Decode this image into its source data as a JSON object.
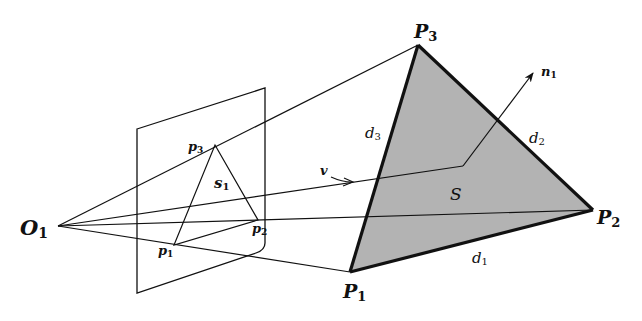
{
  "diagram": {
    "type": "perspective-projection",
    "colors": {
      "line": "#111111",
      "triangle_fill": "#b3b3b3",
      "background": "#ffffff"
    },
    "labels": {
      "camera_center": {
        "main": "O",
        "sub": "1"
      },
      "image_triangle": {
        "main": "s",
        "sub": "1"
      },
      "image_vertices": [
        {
          "main": "p",
          "sub": "1"
        },
        {
          "main": "p",
          "sub": "2"
        },
        {
          "main": "p",
          "sub": "3"
        }
      ],
      "world_vertices": [
        {
          "main": "P",
          "sub": "1"
        },
        {
          "main": "P",
          "sub": "2"
        },
        {
          "main": "P",
          "sub": "3"
        }
      ],
      "edges": [
        {
          "main": "d",
          "sub": "1"
        },
        {
          "main": "d",
          "sub": "2"
        },
        {
          "main": "d",
          "sub": "3"
        }
      ],
      "surface": "S",
      "normal": {
        "main": "n",
        "sub": "1"
      },
      "view_vector": "v"
    }
  }
}
